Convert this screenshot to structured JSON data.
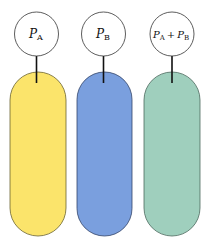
{
  "diagram": {
    "items": [
      {
        "label_main": "P",
        "label_sub": "A",
        "color": "#fbe46b",
        "stroke": "#6b6330"
      },
      {
        "label_main": "P",
        "label_sub": "B",
        "color": "#7a9fde",
        "stroke": "#34456a"
      },
      {
        "label_main": "P",
        "label_sub": "A",
        "label_plus": "+",
        "label_main2": "P",
        "label_sub2": "B",
        "color": "#9fcfbd",
        "stroke": "#4d6a5e"
      }
    ]
  }
}
